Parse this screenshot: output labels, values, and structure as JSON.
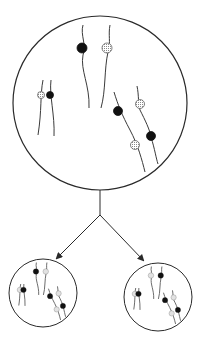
{
  "diagram": {
    "type": "cell-division-chromosome-diagram",
    "colors": {
      "outline": "#2a2a2a",
      "strand": "#3a3a3a",
      "black_allele": "#111111",
      "hatched_allele": "#bdbdbd",
      "background": "#ffffff"
    },
    "parent_cell": {
      "label": "parent-cell",
      "cx": 100,
      "cy": 103,
      "r": 87,
      "chromosomes": [
        {
          "path": "M83 25 C80 35 87 45 83 55 C80 70 90 85 89 108",
          "allele": {
            "x": 82,
            "y": 48,
            "r": 5,
            "kind": "black"
          }
        },
        {
          "path": "M110 25 C108 35 111 42 108 52 C104 70 106 90 101 108",
          "allele": {
            "x": 107,
            "y": 48,
            "r": 5,
            "kind": "hatched"
          }
        },
        {
          "path": "M43 80 C40 95 42 110 38 135",
          "allele": {
            "x": 41,
            "y": 95,
            "r": 3.5,
            "kind": "hatched"
          }
        },
        {
          "path": "M51 80 C49 95 55 115 54 136",
          "allele": {
            "x": 50,
            "y": 95,
            "r": 3.5,
            "kind": "black"
          }
        },
        {
          "path": "M114 92 C118 105 122 115 130 130 C138 145 142 160 145 172",
          "alleles": [
            {
              "x": 118,
              "y": 111,
              "r": 4.5,
              "kind": "black"
            },
            {
              "x": 135,
              "y": 145,
              "r": 4.5,
              "kind": "hatched"
            }
          ]
        },
        {
          "path": "M137 86 C139 95 138 105 140 110 C145 120 150 130 151 137 C155 150 156 158 158 164",
          "alleles": [
            {
              "x": 140,
              "y": 104,
              "r": 4.5,
              "kind": "hatched"
            },
            {
              "x": 151,
              "y": 136,
              "r": 4.5,
              "kind": "black"
            }
          ]
        }
      ]
    },
    "connector": {
      "stem": {
        "x": 100,
        "y1": 190,
        "y2": 215
      },
      "left_arrow": {
        "x1": 100,
        "y1": 215,
        "x2": 57,
        "y2": 258
      },
      "right_arrow": {
        "x1": 100,
        "y1": 215,
        "x2": 143,
        "y2": 260
      }
    },
    "daughter_cells": [
      {
        "label": "daughter-cell-left",
        "cx": 43,
        "cy": 293,
        "r": 34,
        "alleles_top": [
          "black",
          "hatched"
        ],
        "alleles_left_pair": [
          "hatched",
          "black"
        ],
        "alleles_right_group": [
          "black",
          "hatched",
          "hatched",
          "black"
        ]
      },
      {
        "label": "daughter-cell-right",
        "cx": 158,
        "cy": 297,
        "r": 34,
        "alleles_top": [
          "hatched",
          "black"
        ],
        "alleles_left_pair": [
          "hatched",
          "black"
        ],
        "alleles_right_group": [
          "black",
          "hatched",
          "hatched",
          "black"
        ]
      }
    ]
  }
}
